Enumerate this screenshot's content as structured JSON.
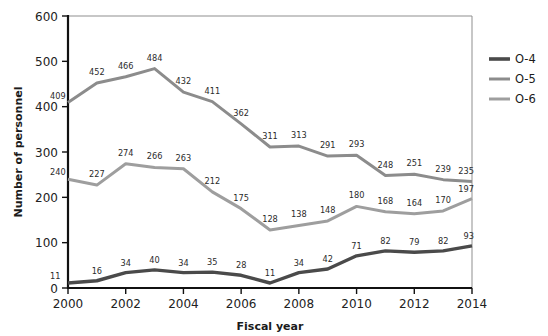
{
  "chart_data": {
    "type": "line",
    "title": "",
    "xlabel": "Fiscal year",
    "ylabel": "Number of personnel",
    "x": [
      2000,
      2001,
      2002,
      2003,
      2004,
      2005,
      2006,
      2007,
      2008,
      2009,
      2010,
      2011,
      2012,
      2013,
      2014
    ],
    "xtick_labels": [
      "2000",
      "2002",
      "2004",
      "2006",
      "2008",
      "2010",
      "2012",
      "2014"
    ],
    "xtick_values": [
      2000,
      2002,
      2004,
      2006,
      2008,
      2010,
      2012,
      2014
    ],
    "ytick_labels": [
      "0",
      "100",
      "200",
      "300",
      "400",
      "500",
      "600"
    ],
    "ytick_values": [
      0,
      100,
      200,
      300,
      400,
      500,
      600
    ],
    "xlim": [
      2000,
      2014
    ],
    "ylim": [
      0,
      600
    ],
    "grid": false,
    "legend_position": "right",
    "data_labels_shown": true,
    "series": [
      {
        "name": "O-4",
        "color": "#4a4a4a",
        "values": [
          11,
          16,
          34,
          40,
          34,
          35,
          28,
          11,
          34,
          42,
          71,
          82,
          79,
          82,
          93
        ]
      },
      {
        "name": "O-5",
        "color": "#8c8c8c",
        "values": [
          409,
          452,
          466,
          484,
          432,
          411,
          362,
          311,
          313,
          291,
          293,
          248,
          251,
          239,
          235
        ]
      },
      {
        "name": "O-6",
        "color": "#9e9e9e",
        "values": [
          240,
          227,
          274,
          266,
          263,
          212,
          175,
          128,
          138,
          148,
          180,
          168,
          164,
          170,
          197
        ]
      }
    ]
  },
  "legend": {
    "items": [
      {
        "label": "O-4"
      },
      {
        "label": "O-5"
      },
      {
        "label": "O-6"
      }
    ]
  },
  "axes": {
    "y_title": "Number of personnel",
    "x_title": "Fiscal year"
  }
}
